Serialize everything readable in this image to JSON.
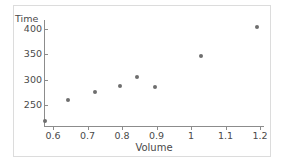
{
  "chart_data": {
    "type": "scatter",
    "title": "",
    "xlabel": "Volume",
    "ylabel": "Time",
    "xlim": [
      0.555,
      1.235
    ],
    "ylim": [
      212,
      415
    ],
    "grid": false,
    "legend": "none",
    "xticks": [
      "0.6",
      "0.7",
      "0.8",
      "0.9",
      "1",
      "1.1",
      "1.2"
    ],
    "xtick_values": [
      0.6,
      0.7,
      0.8,
      0.9,
      1.0,
      1.1,
      1.2
    ],
    "yticks": [
      "250",
      "300",
      "350",
      "400"
    ],
    "ytick_values": [
      250,
      300,
      350,
      400
    ],
    "x": [
      0.577,
      0.643,
      0.723,
      0.795,
      0.844,
      0.896,
      1.03,
      1.19
    ],
    "y": [
      218,
      260,
      276,
      288,
      305,
      286,
      347,
      404
    ],
    "points": [
      {
        "x": 0.577,
        "y": 218
      },
      {
        "x": 0.643,
        "y": 260
      },
      {
        "x": 0.723,
        "y": 276
      },
      {
        "x": 0.795,
        "y": 288
      },
      {
        "x": 0.844,
        "y": 305
      },
      {
        "x": 0.896,
        "y": 286
      },
      {
        "x": 1.03,
        "y": 347
      },
      {
        "x": 1.19,
        "y": 404
      }
    ],
    "marker_color": "#6e6e6e",
    "axis_color": "#8c8c8c",
    "text_color": "#4a4a4a",
    "background": "#ffffff",
    "frame_color": "#dcdcdc"
  }
}
